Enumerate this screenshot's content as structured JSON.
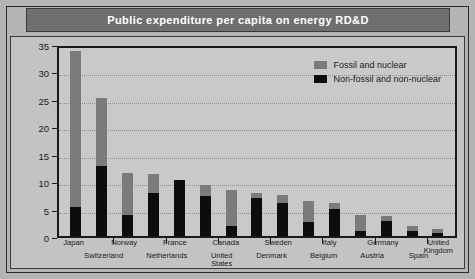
{
  "title": "Public expenditure per capita on energy RD&D",
  "legend": {
    "items": [
      {
        "label": "Fossil and nuclear",
        "color": "#7b7b7b",
        "key": "fossil_nuclear"
      },
      {
        "label": "Non-fossil and non-nuclear",
        "color": "#0d0d0d",
        "key": "non_fossil_non_nuclear"
      }
    ]
  },
  "colors": {
    "title_bar": "#6f6f6f",
    "title_text": "#ffffff",
    "page_background": "#b4b4b4",
    "panel_background": "#c3c3c3",
    "plot_background": "#c9c9c9",
    "axis": "#1a1a1a",
    "gridline": "#8d8d8d",
    "fossil_nuclear": "#7b7b7b",
    "non_fossil_non_nuclear": "#0d0d0d"
  },
  "chart_data": {
    "type": "bar",
    "title": "Public expenditure per capita on energy RD&D",
    "xlabel": "",
    "ylabel": "U.S. dollars per capita",
    "ylim": [
      0,
      35
    ],
    "yticks": [
      0,
      5,
      10,
      15,
      20,
      25,
      30,
      35
    ],
    "grid": true,
    "stacked": true,
    "legend_position": "top-right",
    "categories": [
      "Japan",
      "Switzerland",
      "Norway",
      "Netherlands",
      "France",
      "United States",
      "Canada",
      "Denmark",
      "Sweden",
      "Belgium",
      "Italy",
      "Austria",
      "Germany",
      "Spain",
      "United Kingdom"
    ],
    "series": [
      {
        "name": "Non-fossil and non-nuclear",
        "color": "#0d0d0d",
        "values": [
          5.3,
          12.7,
          3.9,
          7.9,
          10.2,
          7.3,
          1.9,
          7.0,
          6.1,
          2.6,
          5.0,
          1.0,
          2.8,
          1.0,
          0.5
        ]
      },
      {
        "name": "Fossil and nuclear",
        "color": "#7b7b7b",
        "values": [
          28.5,
          12.4,
          7.5,
          3.4,
          0.0,
          2.0,
          6.4,
          0.8,
          1.4,
          3.8,
          1.0,
          2.9,
          0.8,
          0.8,
          0.8
        ]
      }
    ],
    "totals": [
      33.8,
      25.1,
      11.4,
      11.3,
      10.2,
      9.3,
      8.3,
      7.8,
      7.5,
      6.4,
      6.0,
      3.9,
      3.6,
      1.8,
      1.3
    ]
  },
  "xaxis_rows": {
    "top": [
      "Japan",
      "",
      "Norway",
      "",
      "France",
      "",
      "Canada",
      "",
      "Sweden",
      "",
      "Italy",
      "",
      "Germany",
      "",
      "United\nKingdom"
    ],
    "bottom": [
      "",
      "Switzerland",
      "",
      "Netherlands",
      "",
      "United\nStates",
      "",
      "Denmark",
      "",
      "Belgium",
      "",
      "Austria",
      "",
      "Spain",
      ""
    ]
  }
}
